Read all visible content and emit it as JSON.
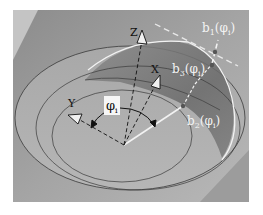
{
  "figure": {
    "labels": {
      "z_axis": "Z",
      "x_axis": "X",
      "y_axis": "Y",
      "angle": "φ",
      "angle_sub": "i",
      "b1": "b",
      "b1_sub": "1",
      "b1_arg": "(φ",
      "b1_arg_sub": "i",
      "b1_close": ")",
      "b2": "b",
      "b2_sub": "2",
      "b2_arg": "(φ",
      "b2_arg_sub": "i",
      "b2_close": ")",
      "b3": "b",
      "b3_sub": "3",
      "b3_arg": "(φ",
      "b3_arg_sub": "i",
      "b3_close": ")"
    },
    "colors": {
      "page_bg": "#ffffff",
      "photo_bg": "#9a9a9a",
      "surface_light": "#b4b4b4",
      "surface_dark": "#6e6e6e",
      "outline": "#3a3a3a",
      "highlight": "#f2f2f2",
      "point": "#555555"
    }
  }
}
